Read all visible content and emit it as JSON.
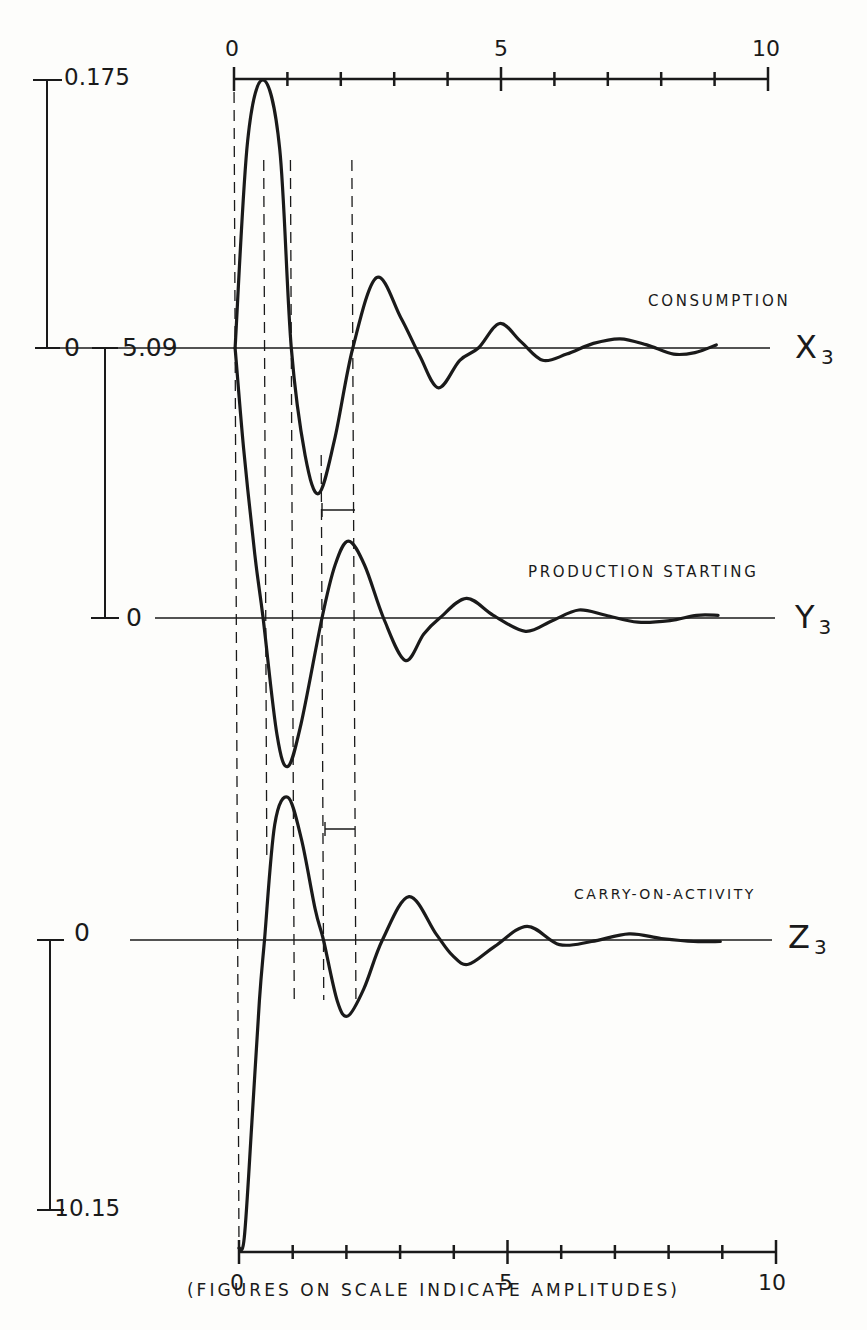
{
  "chart_data": {
    "type": "line",
    "title": "",
    "caption": "(FIGURES ON SCALE INDICATE AMPLITUDES)",
    "xlabel": "",
    "xlim": [
      0,
      10
    ],
    "x_ticks": [
      0,
      1,
      2,
      3,
      4,
      5,
      6,
      7,
      8,
      9,
      10
    ],
    "x_tick_labels": [
      "0",
      "5",
      "10"
    ],
    "grid": false,
    "reference_dashed_lines_x": [
      0,
      0.55,
      1.05,
      1.6,
      2.2
    ],
    "series": [
      {
        "name": "X3",
        "label": "CONSUMPTION",
        "scale_max_label": "0.175",
        "scale_zero_label": "0",
        "x": [
          0,
          0.25,
          0.55,
          0.85,
          1.05,
          1.3,
          1.55,
          1.85,
          2.2,
          2.65,
          3.1,
          3.45,
          3.8,
          4.2,
          4.55,
          4.95,
          5.35,
          5.75,
          6.2,
          6.7,
          7.2,
          7.7,
          8.2,
          8.6,
          9.0
        ],
        "values": [
          0,
          0.135,
          0.175,
          0.13,
          0.0,
          -0.07,
          -0.095,
          -0.06,
          0.0,
          0.046,
          0.02,
          -0.005,
          -0.026,
          -0.008,
          0.0,
          0.016,
          0.004,
          -0.008,
          -0.004,
          0.003,
          0.006,
          0.002,
          -0.004,
          -0.003,
          0.002
        ]
      },
      {
        "name": "Y3",
        "label": "PRODUCTION STARTING",
        "scale_max_label": "5.09",
        "scale_zero_label": "0",
        "x": [
          0,
          0.15,
          0.35,
          0.5,
          0.75,
          0.95,
          1.2,
          1.6,
          1.85,
          2.1,
          2.4,
          2.75,
          3.15,
          3.5,
          3.8,
          4.3,
          4.8,
          5.4,
          5.9,
          6.4,
          6.9,
          7.5,
          8.1,
          8.6,
          9.0
        ],
        "values": [
          5.09,
          3.2,
          1.2,
          0.0,
          -2.2,
          -2.8,
          -2.0,
          0.0,
          1.0,
          1.45,
          1.0,
          0.0,
          -0.8,
          -0.3,
          0.0,
          0.37,
          0.05,
          -0.25,
          -0.05,
          0.15,
          0.05,
          -0.08,
          -0.05,
          0.05,
          0.05
        ]
      },
      {
        "name": "Z3",
        "label": "CARRY-ON-ACTIVITY",
        "scale_min_label": "-10.15",
        "scale_zero_label": "0",
        "x": [
          0,
          0.1,
          0.25,
          0.4,
          0.5,
          0.7,
          0.95,
          1.2,
          1.45,
          1.6,
          1.85,
          2.05,
          2.35,
          2.7,
          3.2,
          3.7,
          4.0,
          4.3,
          4.8,
          5.4,
          6.0,
          6.6,
          7.3,
          7.9,
          8.5,
          9.0
        ],
        "values": [
          -10.15,
          -9.8,
          -6.0,
          -2.0,
          0.0,
          3.8,
          4.7,
          3.3,
          1.0,
          0.0,
          -2.0,
          -2.5,
          -1.6,
          0.0,
          1.43,
          0.2,
          -0.5,
          -0.8,
          -0.2,
          0.45,
          -0.15,
          -0.05,
          0.2,
          0.05,
          -0.05,
          -0.05
        ]
      }
    ]
  },
  "labels": {
    "top_axis": {
      "tick0": "0",
      "tick5": "5",
      "tick10": "10"
    },
    "bottom_axis": {
      "tick0": "0",
      "tick5": "5",
      "tick10": "10"
    },
    "scale_x3_max": "0.175",
    "scale_x3_zero": "0",
    "scale_y3_max": "5.09",
    "scale_y3_zero": "0",
    "scale_z3_zero": "0",
    "scale_z3_min": "-10.15",
    "x3_name": "CONSUMPTION",
    "x3_symbol": "X",
    "x3_sub": "3",
    "y3_name": "PRODUCTION STARTING",
    "y3_symbol": "Y",
    "y3_sub": "3",
    "z3_name": "CARRY-ON-ACTIVITY",
    "z3_symbol": "Z",
    "z3_sub": "3",
    "caption": "(FIGURES ON SCALE INDICATE AMPLITUDES)"
  },
  "colors": {
    "ink": "#1a1a1a",
    "paper": "#fdfdfb"
  }
}
